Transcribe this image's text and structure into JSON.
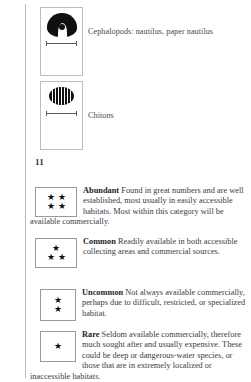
{
  "page": {
    "folio": "11",
    "background_color": "#ffffff",
    "ink_color": "#3f3f40"
  },
  "species_plates": [
    {
      "id": "cephalopods",
      "icon": "nautilus-silhouette-icon",
      "caption": "Cephalopods: nautilus, paper nautilus",
      "scale_bar": true
    },
    {
      "id": "chitons",
      "icon": "chiton-silhouette-icon",
      "caption": "Chitons",
      "scale_bar": true
    }
  ],
  "abundance_key": [
    {
      "id": "abundant",
      "term": "Abundant",
      "stars": 4,
      "star_layout": "2x2",
      "description": "Found in great numbers and are well established, most usually in easily accessible habitats. Most within this category will be available commercially."
    },
    {
      "id": "common",
      "term": "Common",
      "stars": 3,
      "star_layout": "1-over-2",
      "description": "Readily available in both accessible collecting areas and commercial sources."
    },
    {
      "id": "uncommon",
      "term": "Uncommon",
      "stars": 2,
      "star_layout": "stacked",
      "description": "Not always available commercially, perhaps due to difficult, restricted, or specialized habitat."
    },
    {
      "id": "rare",
      "term": "Rare",
      "stars": 1,
      "star_layout": "single",
      "description": "Seldom available commercially, therefore much sought after and usually expensive. These could be deep or dangerous-water species, or those that are in extremely localized or inaccessible habitats."
    }
  ],
  "glyphs": {
    "star": "★"
  }
}
